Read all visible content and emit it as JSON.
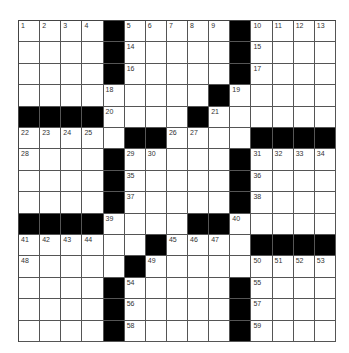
{
  "puzzle": {
    "size": 15,
    "rows": [
      [
        1,
        2,
        3,
        4,
        "#",
        5,
        6,
        7,
        8,
        9,
        "#",
        10,
        11,
        12,
        13
      ],
      [
        0,
        0,
        0,
        0,
        "#",
        14,
        0,
        0,
        0,
        0,
        "#",
        15,
        0,
        0,
        0
      ],
      [
        0,
        0,
        0,
        0,
        "#",
        16,
        0,
        0,
        0,
        0,
        "#",
        17,
        0,
        0,
        0
      ],
      [
        0,
        0,
        0,
        0,
        18,
        0,
        0,
        0,
        0,
        "#",
        19,
        0,
        0,
        0,
        0
      ],
      [
        "#",
        "#",
        "#",
        "#",
        20,
        0,
        0,
        0,
        "#",
        21,
        0,
        0,
        0,
        0,
        0
      ],
      [
        22,
        23,
        24,
        25,
        0,
        "#",
        "#",
        26,
        27,
        0,
        0,
        "#",
        "#",
        "#",
        "#"
      ],
      [
        28,
        0,
        0,
        0,
        "#",
        29,
        30,
        0,
        0,
        0,
        "#",
        31,
        32,
        33,
        34
      ],
      [
        0,
        0,
        0,
        0,
        "#",
        35,
        0,
        0,
        0,
        0,
        "#",
        36,
        0,
        0,
        0
      ],
      [
        0,
        0,
        0,
        0,
        "#",
        37,
        0,
        0,
        0,
        0,
        "#",
        38,
        0,
        0,
        0
      ],
      [
        "#",
        "#",
        "#",
        "#",
        39,
        0,
        0,
        0,
        "#",
        "#",
        40,
        0,
        0,
        0,
        0
      ],
      [
        41,
        42,
        43,
        44,
        0,
        0,
        "#",
        45,
        46,
        47,
        0,
        "#",
        "#",
        "#",
        "#"
      ],
      [
        48,
        0,
        0,
        0,
        0,
        "#",
        49,
        0,
        0,
        0,
        0,
        50,
        51,
        52,
        53
      ],
      [
        0,
        0,
        0,
        0,
        "#",
        54,
        0,
        0,
        0,
        0,
        "#",
        55,
        0,
        0,
        0
      ],
      [
        0,
        0,
        0,
        0,
        "#",
        56,
        0,
        0,
        0,
        0,
        "#",
        57,
        0,
        0,
        0
      ],
      [
        0,
        0,
        0,
        0,
        "#",
        58,
        0,
        0,
        0,
        0,
        "#",
        59,
        0,
        0,
        0
      ]
    ]
  },
  "colors": {
    "block": "#000000",
    "cell": "#ffffff",
    "gridline": "#555555",
    "number": "#333333"
  }
}
